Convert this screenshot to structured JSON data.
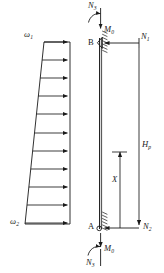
{
  "figure": {
    "background_color": "#ffffff",
    "line_color": "#1a1a1a",
    "width": 164,
    "height": 273
  },
  "load_diagram": {
    "name": "trapezoidal-distributed-load",
    "top_load_label": "ω",
    "top_load_sub": "1",
    "bottom_load_label": "ω",
    "bottom_load_sub": "2",
    "arrow_count": 11,
    "arrow_direction": "right",
    "shape": "trapezoid",
    "top_width_px": 26,
    "bottom_width_px": 45
  },
  "member_diagram": {
    "name": "vertical-member",
    "node_top_label": "B",
    "node_bottom_label": "A",
    "top_force_label": "N",
    "top_force_sub": "3",
    "top_moment_label": "M",
    "top_moment_sub": "0",
    "right_top_force_label": "N",
    "right_top_force_sub": "1",
    "right_bottom_force_label": "N",
    "right_bottom_force_sub": "2",
    "bottom_moment_label": "M",
    "bottom_moment_sub": "0",
    "bottom_force_label": "N",
    "bottom_force_sub": "3",
    "dim_inner_label": "X",
    "dim_outer_label": "H",
    "dim_outer_sub": "p"
  }
}
